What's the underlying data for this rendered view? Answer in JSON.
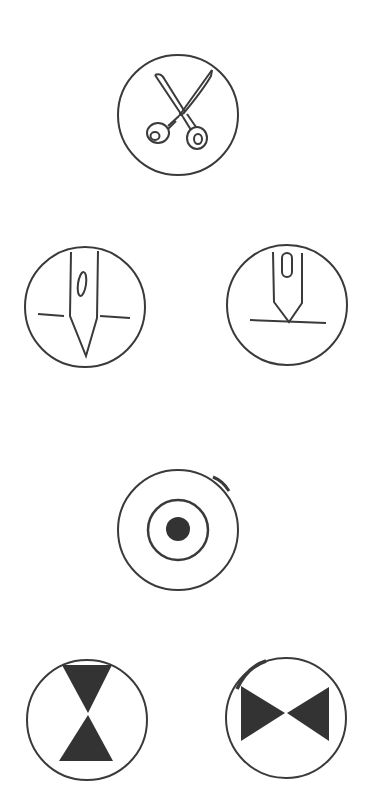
{
  "colors": {
    "background": "#ffffff",
    "stroke": "#3a3a3a",
    "fill": "#333333"
  },
  "symbols": [
    {
      "id": "cut",
      "icon": "scissors-icon",
      "center": [
        178,
        115
      ],
      "radius": 60
    },
    {
      "id": "needle-down",
      "icon": "needle-down-icon",
      "center": [
        85,
        307
      ],
      "radius": 60
    },
    {
      "id": "needle-up",
      "icon": "needle-up-icon",
      "center": [
        287,
        305
      ],
      "radius": 60
    },
    {
      "id": "target",
      "icon": "target-dot-icon",
      "center": [
        178,
        530
      ],
      "radius": 60
    },
    {
      "id": "hourglass",
      "icon": "hourglass-icon",
      "center": [
        87,
        720
      ],
      "radius": 60
    },
    {
      "id": "bowtie",
      "icon": "bowtie-icon",
      "center": [
        286,
        718
      ],
      "radius": 60
    }
  ]
}
